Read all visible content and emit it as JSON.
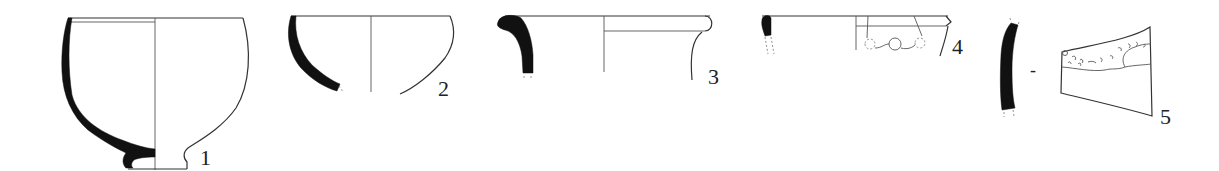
{
  "figure": {
    "type": "archaeological pottery drawing plate",
    "background": "#ffffff",
    "line_color": "#333333",
    "section_fill": "#111111",
    "items": [
      {
        "number": "1",
        "form": "footed cup / deep bowl",
        "view": "half section + half profile"
      },
      {
        "number": "2",
        "form": "hemispherical bowl fragment",
        "view": "half section + half profile"
      },
      {
        "number": "3",
        "form": "everted-rim jar fragment",
        "view": "half section + half profile"
      },
      {
        "number": "4",
        "form": "rim fragment with applied decoration",
        "view": "half section + half profile"
      },
      {
        "number": "5",
        "form": "body sherd with decorated band",
        "view": "section + exterior view",
        "separator": "-"
      }
    ]
  }
}
